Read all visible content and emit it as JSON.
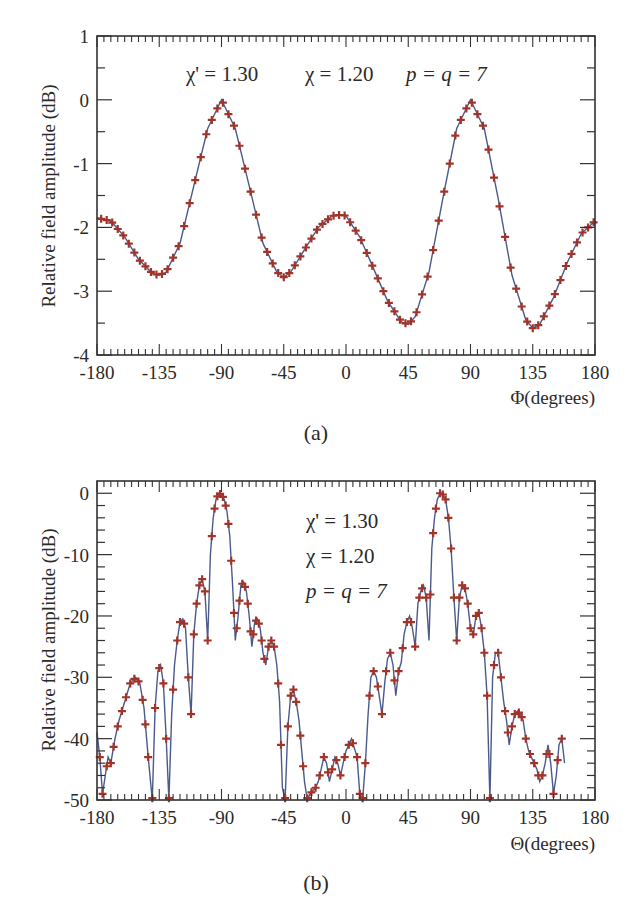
{
  "figure": {
    "panels": [
      "(a)",
      "(b)"
    ]
  },
  "colors": {
    "curve": "#4a5a8c",
    "marker": "#a0342a",
    "axis": "#333333"
  },
  "chart_data": [
    {
      "id": "a",
      "type": "line",
      "caption": "(a)",
      "title": "",
      "xlabel": "Φ(degrees)",
      "ylabel": "Relative field amplitude (dB)",
      "xlim": [
        -180,
        180
      ],
      "ylim": [
        -4,
        1
      ],
      "xticks": [
        -180,
        -135,
        -90,
        -45,
        0,
        45,
        90,
        135,
        180
      ],
      "xtick_labels": [
        "-180",
        "-135",
        "-90",
        "-45",
        "0",
        "45",
        "90",
        "135",
        "180"
      ],
      "yticks": [
        -4,
        -3,
        -2,
        -1,
        0,
        1
      ],
      "ytick_labels": [
        "-4",
        "-3",
        "-2",
        "-1",
        "0",
        "1"
      ],
      "grid": false,
      "annotation": {
        "chi_prime": "χ' = 1.30",
        "chi": "χ  = 1.20",
        "pq": "p = q = 7"
      },
      "series": [
        {
          "name": "analytic (solid line)",
          "style": "line"
        },
        {
          "name": "simulated (+ markers)",
          "style": "marker"
        }
      ],
      "x": [
        -180,
        -170,
        -160,
        -150,
        -140,
        -135,
        -130,
        -120,
        -110,
        -100,
        -90,
        -80,
        -70,
        -60,
        -50,
        -45,
        -40,
        -30,
        -20,
        -10,
        -3,
        0,
        10,
        20,
        30,
        40,
        45,
        50,
        60,
        70,
        80,
        90,
        100,
        110,
        120,
        130,
        135,
        140,
        150,
        160,
        170,
        180
      ],
      "values": [
        -1.85,
        -1.9,
        -2.15,
        -2.5,
        -2.72,
        -2.75,
        -2.7,
        -2.25,
        -1.35,
        -0.45,
        0.0,
        -0.45,
        -1.35,
        -2.25,
        -2.7,
        -2.78,
        -2.7,
        -2.35,
        -2.0,
        -1.82,
        -1.8,
        -1.82,
        -2.15,
        -2.65,
        -3.15,
        -3.48,
        -3.52,
        -3.4,
        -2.7,
        -1.55,
        -0.45,
        0.0,
        -0.45,
        -1.55,
        -2.75,
        -3.45,
        -3.58,
        -3.52,
        -3.1,
        -2.55,
        -2.1,
        -1.9
      ]
    },
    {
      "id": "b",
      "type": "line",
      "caption": "(b)",
      "title": "",
      "xlabel": "Θ(degrees)",
      "ylabel": "Relative field amplitude (dB)",
      "xlim": [
        -180,
        180
      ],
      "ylim": [
        -50,
        2
      ],
      "xticks": [
        -180,
        -135,
        -90,
        -45,
        0,
        45,
        90,
        135,
        180
      ],
      "xtick_labels": [
        "-180",
        "-135",
        "-90",
        "-45",
        "0",
        "45",
        "90",
        "135",
        "180"
      ],
      "yticks": [
        -50,
        -40,
        -30,
        -20,
        -10,
        0
      ],
      "ytick_labels": [
        "-50",
        "-40",
        "-30",
        "-20",
        "-10",
        "0"
      ],
      "grid": false,
      "annotation": {
        "chi_prime": "χ' = 1.30",
        "chi": "χ  = 1.20",
        "pq": "p = q = 7"
      },
      "series": [
        {
          "name": "analytic (solid line)",
          "style": "line"
        },
        {
          "name": "simulated (+ markers)",
          "style": "marker"
        }
      ],
      "x": [
        -180,
        -178,
        -176,
        -174,
        -172,
        -170,
        -167,
        -164,
        -160,
        -156,
        -152,
        -149,
        -146,
        -143,
        -140,
        -138,
        -136,
        -134,
        -132,
        -130,
        -128,
        -126,
        -124,
        -122,
        -120,
        -118,
        -116,
        -114,
        -112,
        -110,
        -108,
        -106,
        -104,
        -102,
        -100,
        -98,
        -96,
        -94,
        -92,
        -90,
        -88,
        -86,
        -84,
        -82,
        -80,
        -78,
        -76,
        -74,
        -72,
        -70,
        -68,
        -66,
        -64,
        -62,
        -60,
        -58,
        -56,
        -54,
        -52,
        -50,
        -48,
        -46,
        -44,
        -42,
        -40,
        -38,
        -36,
        -34,
        -32,
        -30,
        -28,
        -26,
        -24,
        -22,
        -20,
        -18,
        -16,
        -14,
        -12,
        -10,
        -8,
        -6,
        -4,
        -2,
        0,
        2,
        4,
        6,
        8,
        10,
        12,
        14,
        16,
        18,
        20,
        22,
        24,
        26,
        28,
        30,
        32,
        34,
        36,
        38,
        40,
        42,
        44,
        46,
        48,
        50,
        52,
        54,
        56,
        58,
        60,
        62,
        64,
        66,
        68,
        70,
        72,
        74,
        76,
        78,
        80,
        82,
        84,
        86,
        88,
        90,
        92,
        94,
        96,
        98,
        100,
        102,
        104,
        106,
        108,
        110,
        112,
        114,
        116,
        118,
        120,
        122,
        124,
        126,
        128,
        130,
        132,
        134,
        136,
        138,
        140,
        142,
        144,
        146,
        148,
        150,
        152,
        154,
        156,
        158,
        160,
        162,
        164,
        166,
        168,
        170,
        172,
        174,
        176,
        178,
        180
      ],
      "values": [
        -39,
        -43,
        -49,
        -46,
        -43,
        -44,
        -40,
        -37,
        -34,
        -31,
        -30,
        -31,
        -35,
        -43,
        -50,
        -35,
        -29,
        -28,
        -31,
        -40,
        -50,
        -36,
        -28,
        -24,
        -21,
        -20.5,
        -22,
        -30,
        -36,
        -23,
        -18,
        -15,
        -14,
        -16,
        -24,
        -10,
        -4,
        -1,
        0,
        -0.2,
        -1,
        -3,
        -7,
        -15,
        -24,
        -20,
        -15,
        -14.5,
        -16,
        -20,
        -25,
        -21,
        -20.5,
        -22,
        -26,
        -28,
        -25,
        -24,
        -25,
        -28,
        -34,
        -48,
        -50,
        -38,
        -33,
        -32,
        -34,
        -37,
        -42,
        -47,
        -50,
        -49,
        -48.5,
        -48,
        -47,
        -45,
        -43,
        -44,
        -47,
        -45,
        -43,
        -44,
        -46,
        -44,
        -42,
        -41,
        -40,
        -41.5,
        -43,
        -49,
        -50,
        -44,
        -36,
        -30,
        -29,
        -30,
        -33,
        -36,
        -31,
        -27,
        -26,
        -28,
        -33,
        -29,
        -27.5,
        -23,
        -21,
        -20,
        -22,
        -25,
        -18,
        -16,
        -15,
        -17,
        -24,
        -9,
        -4,
        -1,
        0,
        -0.2,
        -1,
        -4,
        -9,
        -17,
        -24,
        -17,
        -15,
        -15.5,
        -18,
        -22,
        -23,
        -20,
        -19.5,
        -22,
        -26,
        -33,
        -50,
        -30,
        -26,
        -26,
        -30,
        -34,
        -37,
        -41,
        -38,
        -36,
        -35.5,
        -36,
        -37,
        -40,
        -42,
        -43,
        -44,
        -45,
        -47,
        -46,
        -44,
        -41,
        -44,
        -49,
        -46,
        -41,
        -40,
        -44
      ],
      "markers_x": [
        -178,
        -176,
        -173,
        -170,
        -168,
        -165,
        -162,
        -159,
        -156,
        -153,
        -150,
        -147,
        -145,
        -143,
        -140,
        -138,
        -135,
        -132,
        -130,
        -128,
        -125,
        -122,
        -120,
        -117,
        -114,
        -112,
        -110,
        -108,
        -106,
        -104,
        -102,
        -100,
        -97,
        -95,
        -93,
        -91,
        -89,
        -87,
        -85,
        -83,
        -81,
        -79,
        -77,
        -75,
        -73,
        -71,
        -69,
        -67,
        -65,
        -63,
        -61,
        -59,
        -56,
        -54,
        -52,
        -49,
        -47,
        -44,
        -42,
        -40,
        -38,
        -36,
        -33,
        -31,
        -28,
        -25,
        -22,
        -19,
        -16,
        -13,
        -10,
        -7,
        -4,
        -1,
        2,
        5,
        8,
        10,
        12,
        14,
        17,
        20,
        23,
        26,
        29,
        32,
        35,
        38,
        41,
        44,
        47,
        50,
        53,
        55,
        58,
        61,
        63,
        65,
        68,
        70,
        72,
        74,
        76,
        78,
        80,
        82,
        84,
        86,
        88,
        90,
        92,
        94,
        96,
        98,
        100,
        102,
        104,
        107,
        110,
        112,
        115,
        117,
        120,
        122,
        125,
        127,
        130,
        133,
        136,
        139,
        142,
        145,
        147,
        150,
        153,
        156,
        159,
        162,
        165,
        168,
        171,
        174,
        177
      ]
    }
  ]
}
